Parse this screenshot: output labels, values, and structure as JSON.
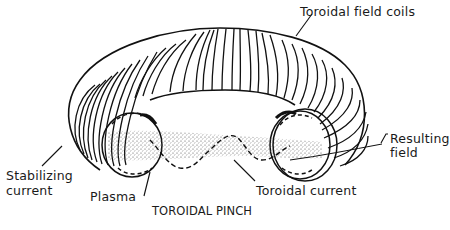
{
  "diagram": {
    "caption": "TOROIDAL PINCH",
    "labels": {
      "toroidal_field_coils": "Toroidal field coils",
      "resulting_field_line1": "Resulting",
      "resulting_field_line2": "field",
      "stabilizing_current_line1": "Stabilizing",
      "stabilizing_current_line2": "current",
      "plasma": "Plasma",
      "toroidal_current": "Toroidal current"
    },
    "colors": {
      "line": "#111111",
      "background": "#ffffff",
      "plasma_stipple": "#444444"
    }
  }
}
